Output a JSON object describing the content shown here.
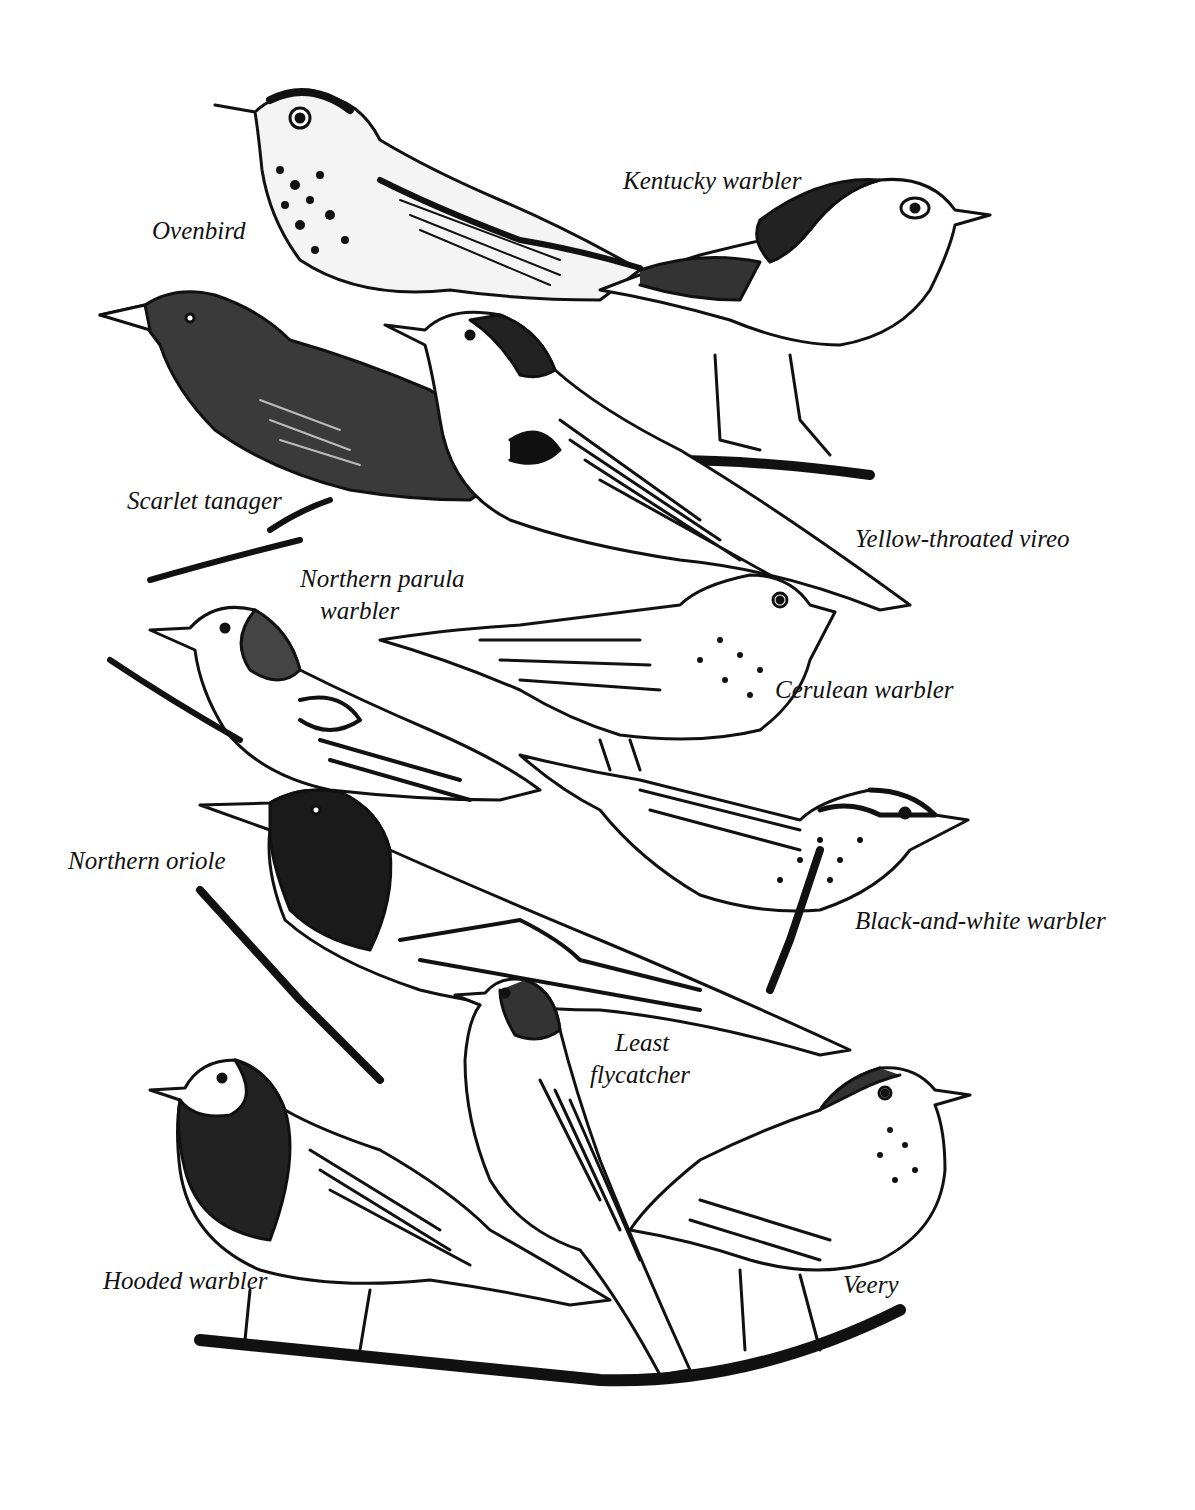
{
  "figure": {
    "background": "#ffffff",
    "ink": "#111111",
    "labels": [
      {
        "id": "ovenbird",
        "text": "Ovenbird",
        "x": 152,
        "y": 218
      },
      {
        "id": "kentucky-warbler",
        "text": "Kentucky warbler",
        "x": 623,
        "y": 168
      },
      {
        "id": "scarlet-tanager",
        "text": "Scarlet tanager",
        "x": 127,
        "y": 488
      },
      {
        "id": "yellow-throated-vireo",
        "text": "Yellow-throated vireo",
        "x": 855,
        "y": 526
      },
      {
        "id": "northern-parula-warbler-1",
        "text": "Northern parula",
        "x": 300,
        "y": 566
      },
      {
        "id": "northern-parula-warbler-2",
        "text": "warbler",
        "x": 320,
        "y": 598
      },
      {
        "id": "cerulean-warbler",
        "text": "Cerulean warbler",
        "x": 775,
        "y": 677
      },
      {
        "id": "northern-oriole",
        "text": "Northern oriole",
        "x": 68,
        "y": 848
      },
      {
        "id": "black-and-white-warbler",
        "text": "Black-and-white warbler",
        "x": 855,
        "y": 908
      },
      {
        "id": "least-flycatcher-1",
        "text": "Least",
        "x": 615,
        "y": 1030
      },
      {
        "id": "least-flycatcher-2",
        "text": "flycatcher",
        "x": 590,
        "y": 1062
      },
      {
        "id": "hooded-warbler",
        "text": "Hooded warbler",
        "x": 103,
        "y": 1268
      },
      {
        "id": "veery",
        "text": "Veery",
        "x": 843,
        "y": 1272
      }
    ]
  }
}
